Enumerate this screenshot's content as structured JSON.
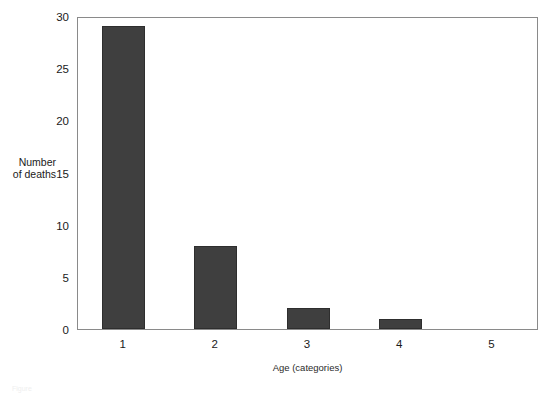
{
  "chart_data": {
    "type": "bar",
    "title": "",
    "categories": [
      "1",
      "2",
      "3",
      "4",
      "5"
    ],
    "values": [
      29,
      8,
      2,
      1,
      0
    ],
    "xlabel": "Age (categories)",
    "ylabel": "Number of deaths",
    "ylabel_lines": [
      "Number",
      "of deaths"
    ],
    "ylim": [
      0,
      30
    ],
    "yticks": [
      0,
      5,
      10,
      15,
      20,
      25,
      30
    ],
    "ytick_labels": [
      "0",
      "5",
      "10",
      "15",
      "20",
      "25",
      "30"
    ],
    "grid": false,
    "legend": false,
    "bar_color": "#3f3f3f",
    "bar_edge_color": "#2e2e2e",
    "frame_color": "#8a8a8a",
    "background": "#ffffff"
  },
  "caption": {
    "text": "Figure"
  }
}
